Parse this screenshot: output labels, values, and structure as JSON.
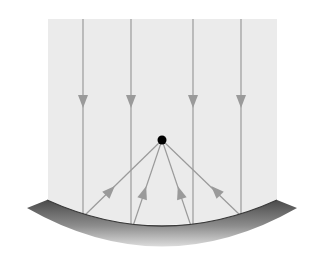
{
  "diagram": {
    "colors": {
      "background": "#ffffff",
      "panel": "#ebebeb",
      "ray": "#9a9a9a",
      "focal_point": "#000000",
      "mirror_dark": "#4a4a4a",
      "mirror_light": "#d4d4d4"
    },
    "incident_rays_x": [
      83,
      131,
      193,
      241
    ],
    "focal_point": {
      "x": 162,
      "y": 140
    },
    "mirror_type": "concave"
  }
}
